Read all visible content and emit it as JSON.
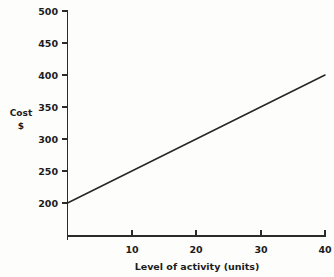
{
  "chart_data": {
    "type": "line",
    "title": "",
    "xlabel": "Level of activity (units)",
    "ylabel": "Cost",
    "ylabel_unit": "$",
    "x": [
      0,
      40
    ],
    "values": [
      200,
      400
    ],
    "series": [
      {
        "name": "Total cost",
        "x": [
          0,
          40
        ],
        "values": [
          200,
          400
        ]
      }
    ],
    "xlim": [
      0,
      40
    ],
    "ylim": [
      149,
      500
    ],
    "y_axis_visible_min": 200,
    "xticks": [
      10,
      20,
      30,
      40
    ],
    "xtick_labels": [
      "10",
      "20",
      "30",
      "40"
    ],
    "yticks": [
      200,
      250,
      300,
      350,
      400,
      450,
      500
    ],
    "ytick_labels": [
      "200",
      "250",
      "300",
      "350",
      "400",
      "450",
      "500"
    ],
    "grid": false,
    "legend": "none",
    "annotations": [],
    "line_color": "#262626",
    "axis_color": "#2b2b2b",
    "background_color": "#fdfdfc",
    "intercept": 200,
    "slope": 5
  }
}
